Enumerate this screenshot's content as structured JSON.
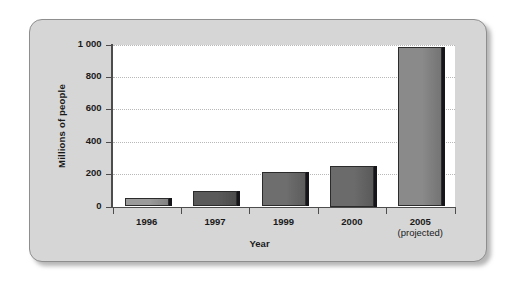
{
  "chart_data": {
    "type": "bar",
    "title": "",
    "xlabel": "Year",
    "ylabel": "Millions of people",
    "categories": [
      "1996",
      "1997",
      "1999",
      "2000",
      "2005"
    ],
    "category_sublabels": [
      "",
      "",
      "",
      "",
      "(projected)"
    ],
    "values": [
      50,
      95,
      210,
      250,
      985
    ],
    "ylim": [
      0,
      1000
    ],
    "yticks": [
      0,
      200,
      400,
      600,
      800,
      1000
    ],
    "ytick_labels": [
      "0",
      "200",
      "400",
      "600",
      "800",
      "1 000"
    ],
    "grid": true,
    "legend": null,
    "bar_colors": [
      "#9b9b9b",
      "#5a5a5a",
      "#6e6e6e",
      "#6b6b6b",
      "#8a8a8a"
    ],
    "bar_shadow_color": "#15151a",
    "plot_background": "#ffffff",
    "frame_background": "#d6d6d6",
    "frame_border_color": "#8e8e8e",
    "axis_color": "#4d4d4d",
    "gridline_color": "#b8b8b8"
  }
}
